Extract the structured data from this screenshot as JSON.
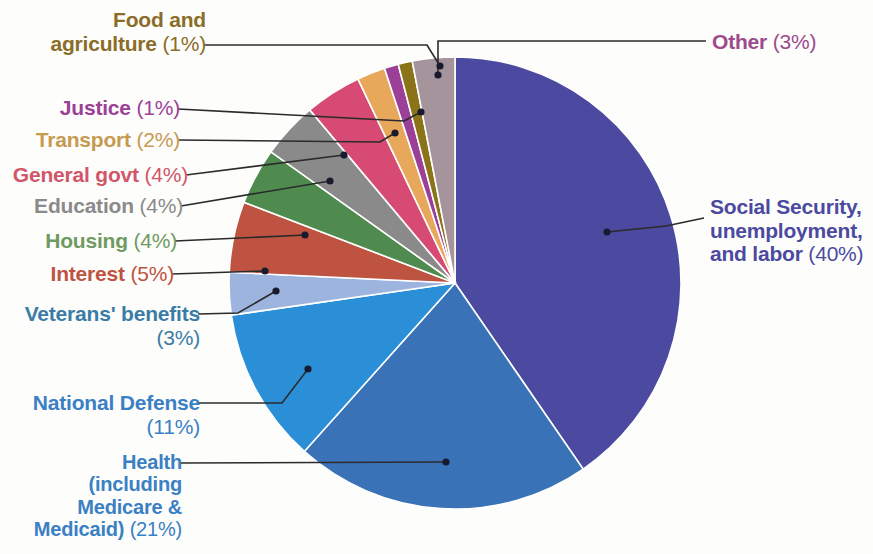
{
  "chart_data": {
    "type": "pie",
    "title": "",
    "total_percent": 99,
    "legend_position": "callout-labels",
    "slices": [
      {
        "name": "Social Security, unemployment, and labor",
        "label": "Social Security, unemployment,",
        "label_line2": "and labor",
        "percent": 40,
        "pct_text": "(40%)",
        "color": "#4b4aa0",
        "text_color": "#4b4aa0"
      },
      {
        "name": "Health (including Medicare & Medicaid)",
        "label": "Health",
        "percent": 21,
        "pct_text": "(21%)",
        "color": "#3a72b8",
        "text_color": "#3a80c4"
      },
      {
        "name": "National Defense",
        "label": "National Defense",
        "percent": 11,
        "pct_text": "(11%)",
        "color": "#2b8fd8",
        "text_color": "#3a80c4"
      },
      {
        "name": "Veterans' benefits",
        "label": "Veterans' benefits",
        "percent": 3,
        "pct_text": "(3%)",
        "color": "#9cb4de",
        "text_color": "#3a7ca5"
      },
      {
        "name": "Interest",
        "label": "Interest",
        "percent": 5,
        "pct_text": "(5%)",
        "color": "#bd5340",
        "text_color": "#bd5340"
      },
      {
        "name": "Housing",
        "label": "Housing",
        "percent": 4,
        "pct_text": "(4%)",
        "color": "#4f8a4f",
        "text_color": "#6f9a62"
      },
      {
        "name": "Education",
        "label": "Education",
        "percent": 4,
        "pct_text": "(4%)",
        "color": "#8a8a8a",
        "text_color": "#8a8a8a"
      },
      {
        "name": "General govt",
        "label": "General govt",
        "percent": 4,
        "pct_text": "(4%)",
        "color": "#d64a74",
        "text_color": "#d1566a"
      },
      {
        "name": "Transport",
        "label": "Transport",
        "percent": 2,
        "pct_text": "(2%)",
        "color": "#e8a85c",
        "text_color": "#c79a52"
      },
      {
        "name": "Justice",
        "label": "Justice",
        "percent": 1,
        "pct_text": "(1%)",
        "color": "#9c3f96",
        "text_color": "#9c3f96"
      },
      {
        "name": "Food and agriculture",
        "label": "Food and",
        "label_line2": "agriculture",
        "percent": 1,
        "pct_text": "(1%)",
        "color": "#8a7318",
        "text_color": "#8a6d28"
      },
      {
        "name": "Other",
        "label": "Other",
        "percent": 3,
        "pct_text": "(3%)",
        "color": "#a5949c",
        "text_color": "#9c4a8c"
      }
    ]
  },
  "labels": {
    "food_and_agriculture": {
      "l1": "Food and",
      "l2": "agriculture",
      "pct": "(1%)"
    },
    "justice": {
      "l1": "Justice",
      "pct": "(1%)"
    },
    "transport": {
      "l1": "Transport",
      "pct": "(2%)"
    },
    "general_govt": {
      "l1": "General govt",
      "pct": "(4%)"
    },
    "education": {
      "l1": "Education",
      "pct": "(4%)"
    },
    "housing": {
      "l1": "Housing",
      "pct": "(4%)"
    },
    "interest": {
      "l1": "Interest",
      "pct": "(5%)"
    },
    "veterans": {
      "l1": "Veterans' benefits",
      "pct": "(3%)"
    },
    "national_defense": {
      "l1": "National Defense",
      "pct": "(11%)"
    },
    "health": {
      "l1": "Health",
      "l2": "(including",
      "l3": "Medicare &",
      "l4": "Medicaid)",
      "pct": "(21%)"
    },
    "other": {
      "l1": "Other",
      "pct": "(3%)"
    },
    "social_security": {
      "l1": "Social Security,",
      "l2": "unemployment,",
      "l3": "and labor",
      "pct": "(40%)"
    }
  }
}
